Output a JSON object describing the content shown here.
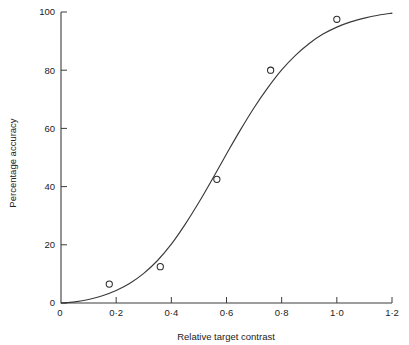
{
  "chart_data": {
    "type": "line",
    "title": "",
    "subtitle": "",
    "xlabel": "Relative target contrast",
    "ylabel": "Percentage accuracy",
    "xlim": [
      0,
      1.2
    ],
    "ylim": [
      0,
      100
    ],
    "grid": false,
    "legend": "none",
    "x_tick_labels": [
      "0",
      "0·2",
      "0·4",
      "0·6",
      "0·8",
      "1·0",
      "1·2"
    ],
    "x_tick_values": [
      0,
      0.2,
      0.4,
      0.6,
      0.8,
      1.0,
      1.2
    ],
    "y_tick_labels": [
      "0",
      "20",
      "40",
      "60",
      "80",
      "100"
    ],
    "y_tick_values": [
      0,
      20,
      40,
      60,
      80,
      100
    ],
    "series": [
      {
        "name": "fitted curve",
        "style": "line",
        "marker": "none",
        "color": "#3a3a3a",
        "x": [
          0.0,
          0.05,
          0.1,
          0.15,
          0.2,
          0.25,
          0.3,
          0.35,
          0.4,
          0.45,
          0.5,
          0.55,
          0.6,
          0.65,
          0.7,
          0.75,
          0.8,
          0.85,
          0.9,
          0.95,
          1.0,
          1.05,
          1.1,
          1.15,
          1.2
        ],
        "y": [
          0.0,
          0.4,
          1.2,
          2.5,
          4.3,
          6.8,
          10.2,
          14.6,
          20.2,
          27.0,
          34.6,
          42.8,
          51.2,
          59.4,
          67.1,
          74.0,
          80.1,
          85.1,
          89.2,
          92.4,
          94.8,
          96.6,
          97.9,
          98.9,
          99.6
        ]
      },
      {
        "name": "observed data",
        "style": "scatter",
        "marker": "open-circle",
        "color": "#2b2b2b",
        "x": [
          0.175,
          0.36,
          0.565,
          0.76,
          1.0
        ],
        "y": [
          6.5,
          12.5,
          42.5,
          80.0,
          97.5
        ]
      }
    ],
    "annotations": []
  },
  "figure": {
    "axis_color": "#3c3c3c",
    "curve_color": "#3a3a3a",
    "marker_color": "#2b2b2b",
    "background": "#ffffff"
  }
}
